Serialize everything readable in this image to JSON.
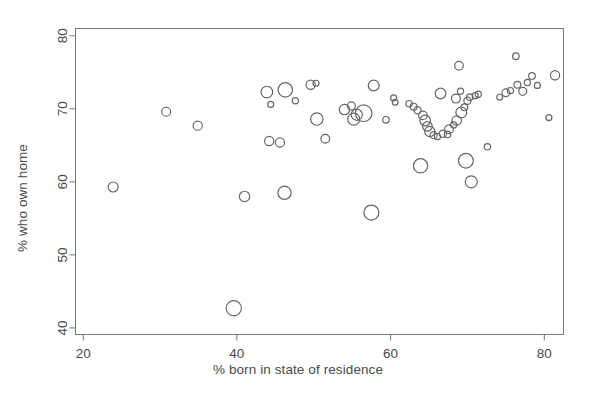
{
  "chart_data": {
    "type": "scatter",
    "title": "",
    "xlabel": "% born in state of residence",
    "ylabel": "% who own home",
    "xlim": [
      19.0,
      82.5
    ],
    "ylim": [
      39.1,
      81.0
    ],
    "xticks": [
      20,
      40,
      60,
      80
    ],
    "yticks": [
      40,
      50,
      60,
      70,
      80
    ],
    "grid": false,
    "legend": null,
    "marker": "open-circle",
    "marker_color": "#666666",
    "size_encoding": "bubble area proportional to population weight",
    "points": [
      {
        "x": 23.9,
        "y": 59.3,
        "r": 5.0
      },
      {
        "x": 30.8,
        "y": 69.6,
        "r": 4.5
      },
      {
        "x": 34.9,
        "y": 67.7,
        "r": 4.6
      },
      {
        "x": 39.6,
        "y": 42.7,
        "r": 7.6
      },
      {
        "x": 41.0,
        "y": 58.0,
        "r": 5.2
      },
      {
        "x": 43.9,
        "y": 72.3,
        "r": 5.8
      },
      {
        "x": 44.4,
        "y": 70.6,
        "r": 3.0
      },
      {
        "x": 44.2,
        "y": 65.6,
        "r": 4.6
      },
      {
        "x": 45.6,
        "y": 65.4,
        "r": 4.6
      },
      {
        "x": 46.2,
        "y": 58.5,
        "r": 6.6
      },
      {
        "x": 46.3,
        "y": 72.6,
        "r": 7.2
      },
      {
        "x": 47.6,
        "y": 71.1,
        "r": 3.1
      },
      {
        "x": 49.6,
        "y": 73.3,
        "r": 4.6
      },
      {
        "x": 50.3,
        "y": 73.5,
        "r": 3.0
      },
      {
        "x": 50.4,
        "y": 68.6,
        "r": 6.2
      },
      {
        "x": 51.5,
        "y": 65.9,
        "r": 4.4
      },
      {
        "x": 54.0,
        "y": 69.9,
        "r": 5.2
      },
      {
        "x": 54.9,
        "y": 70.4,
        "r": 4.0
      },
      {
        "x": 55.2,
        "y": 68.6,
        "r": 6.0
      },
      {
        "x": 55.6,
        "y": 69.2,
        "r": 5.6
      },
      {
        "x": 56.5,
        "y": 69.4,
        "r": 8.3
      },
      {
        "x": 57.5,
        "y": 55.8,
        "r": 7.5
      },
      {
        "x": 57.8,
        "y": 73.2,
        "r": 5.4
      },
      {
        "x": 59.4,
        "y": 68.5,
        "r": 3.3
      },
      {
        "x": 60.4,
        "y": 71.5,
        "r": 3.0
      },
      {
        "x": 60.6,
        "y": 70.9,
        "r": 2.9
      },
      {
        "x": 62.4,
        "y": 70.7,
        "r": 3.2
      },
      {
        "x": 63.0,
        "y": 70.3,
        "r": 3.4
      },
      {
        "x": 63.5,
        "y": 69.8,
        "r": 3.6
      },
      {
        "x": 63.9,
        "y": 62.2,
        "r": 7.1
      },
      {
        "x": 64.2,
        "y": 69.1,
        "r": 4.3
      },
      {
        "x": 64.5,
        "y": 68.4,
        "r": 5.3
      },
      {
        "x": 64.8,
        "y": 67.6,
        "r": 4.8
      },
      {
        "x": 65.1,
        "y": 66.9,
        "r": 5.1
      },
      {
        "x": 65.6,
        "y": 66.4,
        "r": 3.6
      },
      {
        "x": 66.1,
        "y": 66.2,
        "r": 3.1
      },
      {
        "x": 66.5,
        "y": 72.1,
        "r": 5.3
      },
      {
        "x": 66.8,
        "y": 66.6,
        "r": 3.6
      },
      {
        "x": 67.4,
        "y": 66.5,
        "r": 3.2
      },
      {
        "x": 67.6,
        "y": 67.2,
        "r": 4.4
      },
      {
        "x": 68.2,
        "y": 67.8,
        "r": 3.1
      },
      {
        "x": 68.6,
        "y": 68.4,
        "r": 4.7
      },
      {
        "x": 68.5,
        "y": 71.4,
        "r": 4.4
      },
      {
        "x": 68.9,
        "y": 75.9,
        "r": 4.3
      },
      {
        "x": 69.1,
        "y": 72.4,
        "r": 3.1
      },
      {
        "x": 69.2,
        "y": 69.5,
        "r": 5.4
      },
      {
        "x": 69.6,
        "y": 70.2,
        "r": 3.4
      },
      {
        "x": 69.8,
        "y": 62.9,
        "r": 7.4
      },
      {
        "x": 70.0,
        "y": 71.1,
        "r": 3.6
      },
      {
        "x": 70.3,
        "y": 71.6,
        "r": 3.2
      },
      {
        "x": 70.5,
        "y": 60.0,
        "r": 6.0
      },
      {
        "x": 71.0,
        "y": 71.8,
        "r": 3.0
      },
      {
        "x": 71.4,
        "y": 72.0,
        "r": 3.1
      },
      {
        "x": 72.6,
        "y": 64.8,
        "r": 3.2
      },
      {
        "x": 74.2,
        "y": 71.6,
        "r": 2.9
      },
      {
        "x": 75.0,
        "y": 72.2,
        "r": 3.8
      },
      {
        "x": 75.6,
        "y": 72.5,
        "r": 3.1
      },
      {
        "x": 76.3,
        "y": 77.2,
        "r": 3.3
      },
      {
        "x": 76.5,
        "y": 73.3,
        "r": 3.4
      },
      {
        "x": 77.2,
        "y": 72.4,
        "r": 4.0
      },
      {
        "x": 77.8,
        "y": 73.6,
        "r": 3.1
      },
      {
        "x": 78.4,
        "y": 74.5,
        "r": 3.3
      },
      {
        "x": 79.1,
        "y": 73.2,
        "r": 3.0
      },
      {
        "x": 80.6,
        "y": 68.8,
        "r": 3.0
      },
      {
        "x": 81.4,
        "y": 74.6,
        "r": 4.6
      }
    ]
  },
  "colors": {
    "marker_stroke": "#666666",
    "axis": "#777777",
    "text": "#4a4a4a",
    "background": "#ffffff"
  }
}
